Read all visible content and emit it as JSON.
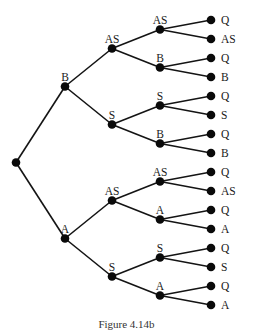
{
  "diagram": {
    "type": "tree",
    "orientation": "left-to-right",
    "root": {
      "label": "",
      "children": [
        {
          "label": "B",
          "children": [
            {
              "label": "AS",
              "children": [
                {
                  "label": "AS",
                  "children": [
                    {
                      "label": "Q"
                    },
                    {
                      "label": "AS"
                    }
                  ]
                },
                {
                  "label": "B",
                  "children": [
                    {
                      "label": "Q"
                    },
                    {
                      "label": "B"
                    }
                  ]
                }
              ]
            },
            {
              "label": "S",
              "children": [
                {
                  "label": "S",
                  "children": [
                    {
                      "label": "Q"
                    },
                    {
                      "label": "S"
                    }
                  ]
                },
                {
                  "label": "B",
                  "children": [
                    {
                      "label": "Q"
                    },
                    {
                      "label": "B"
                    }
                  ]
                }
              ]
            }
          ]
        },
        {
          "label": "A",
          "children": [
            {
              "label": "AS",
              "children": [
                {
                  "label": "AS",
                  "children": [
                    {
                      "label": "Q"
                    },
                    {
                      "label": "AS"
                    }
                  ]
                },
                {
                  "label": "A",
                  "children": [
                    {
                      "label": "Q"
                    },
                    {
                      "label": "A"
                    }
                  ]
                }
              ]
            },
            {
              "label": "S",
              "children": [
                {
                  "label": "S",
                  "children": [
                    {
                      "label": "Q"
                    },
                    {
                      "label": "S"
                    }
                  ]
                },
                {
                  "label": "A",
                  "children": [
                    {
                      "label": "Q"
                    },
                    {
                      "label": "A"
                    }
                  ]
                }
              ]
            }
          ]
        }
      ]
    }
  },
  "caption": "Figure 4.14b"
}
